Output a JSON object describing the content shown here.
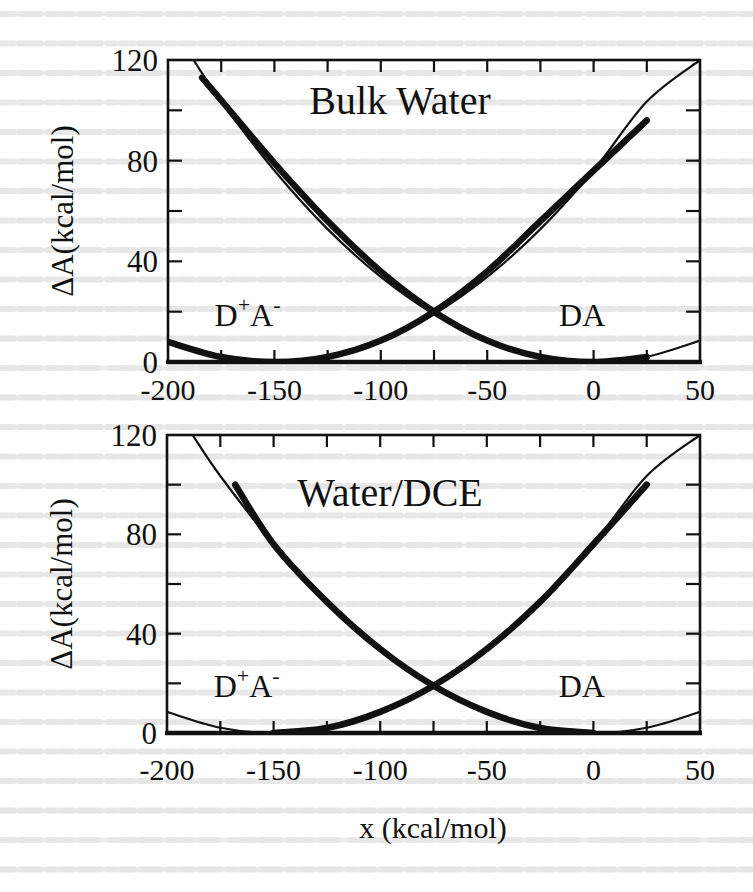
{
  "figure": {
    "xlabel": "x (kcal/mol)",
    "ylabel": "ΔA(kcal/mol)",
    "colors": {
      "ink": "#111111",
      "background": "#ffffff",
      "bleed_text": "#d9d9d9"
    }
  },
  "chart_data": [
    {
      "type": "line",
      "title": "Bulk Water",
      "xlabel": "x (kcal/mol)",
      "ylabel": "ΔA(kcal/mol)",
      "xlim": [
        -200,
        50
      ],
      "ylim": [
        0,
        120
      ],
      "xticks": [
        -200,
        -150,
        -100,
        -50,
        0,
        50
      ],
      "xtick_labels": [
        "-200",
        "-150",
        "-100",
        "-50",
        "0",
        "50"
      ],
      "yticks": [
        0,
        40,
        80,
        120
      ],
      "ytick_labels": [
        "0",
        "40",
        "80",
        "120"
      ],
      "minor_xticks": [
        -175,
        -125,
        -75,
        -25,
        25
      ],
      "minor_yticks": [
        20,
        60,
        100
      ],
      "grid": false,
      "annotations": [
        {
          "text": "D+A-",
          "label_main": "D",
          "sup1": "+",
          "mid": "A",
          "sup2": "-",
          "x": -180,
          "y": 20
        },
        {
          "text": "DA",
          "x": -20,
          "y": 20
        }
      ],
      "series": [
        {
          "name": "DA (parabola, thin)",
          "style": "thin",
          "x": [
            -188,
            -175,
            -150,
            -125,
            -100,
            -75,
            -50,
            -25,
            0,
            25,
            50
          ],
          "y": [
            120,
            103.5,
            76.1,
            52.8,
            33.8,
            19.0,
            8.5,
            2.1,
            0,
            2.1,
            8.5
          ]
        },
        {
          "name": "D+A- (parabola, thin)",
          "style": "thin",
          "x": [
            -200,
            -175,
            -150,
            -125,
            -100,
            -75,
            -50,
            -25,
            0,
            25,
            50
          ],
          "y": [
            8.5,
            2.1,
            0,
            2.1,
            8.5,
            19.0,
            33.8,
            52.8,
            76.1,
            103.5,
            120
          ]
        },
        {
          "name": "DA (simulation, thick)",
          "style": "thick",
          "x": [
            -184,
            -175,
            -150,
            -125,
            -100,
            -75,
            -50,
            -25,
            0,
            25
          ],
          "y": [
            113,
            104,
            79,
            56,
            36,
            20,
            8.5,
            2,
            0,
            2
          ]
        },
        {
          "name": "D+A- (simulation, thick)",
          "style": "thick",
          "x": [
            -200,
            -175,
            -150,
            -125,
            -100,
            -75,
            -50,
            -25,
            0,
            25
          ],
          "y": [
            8,
            2,
            0,
            2,
            8.5,
            20,
            36,
            56,
            76,
            96
          ]
        }
      ]
    },
    {
      "type": "line",
      "title": "Water/DCE",
      "xlabel": "x (kcal/mol)",
      "ylabel": "ΔA(kcal/mol)",
      "xlim": [
        -200,
        50
      ],
      "ylim": [
        0,
        120
      ],
      "xticks": [
        -200,
        -150,
        -100,
        -50,
        0,
        50
      ],
      "xtick_labels": [
        "-200",
        "-150",
        "-100",
        "-50",
        "0",
        "50"
      ],
      "yticks": [
        0,
        40,
        80,
        120
      ],
      "ytick_labels": [
        "0",
        "40",
        "80",
        "120"
      ],
      "minor_xticks": [
        -175,
        -125,
        -75,
        -25,
        25
      ],
      "minor_yticks": [
        20,
        60,
        100
      ],
      "grid": false,
      "annotations": [
        {
          "text": "D+A-",
          "label_main": "D",
          "sup1": "+",
          "mid": "A",
          "sup2": "-",
          "x": -180,
          "y": 20
        },
        {
          "text": "DA",
          "x": -20,
          "y": 20
        }
      ],
      "series": [
        {
          "name": "DA (parabola, thin)",
          "style": "thin",
          "x": [
            -188,
            -175,
            -150,
            -125,
            -100,
            -75,
            -50,
            -25,
            0,
            25,
            50
          ],
          "y": [
            120,
            103.5,
            76.1,
            52.8,
            33.8,
            19.0,
            8.5,
            2.1,
            0,
            2.1,
            8.5
          ]
        },
        {
          "name": "D+A- (parabola, thin)",
          "style": "thin",
          "x": [
            -200,
            -175,
            -150,
            -125,
            -100,
            -75,
            -50,
            -25,
            0,
            25,
            50
          ],
          "y": [
            8.5,
            2.1,
            0,
            2.1,
            8.5,
            19.0,
            33.8,
            52.8,
            76.1,
            103.5,
            120
          ]
        },
        {
          "name": "DA (simulation, thick)",
          "style": "thick",
          "x": [
            -168,
            -150,
            -125,
            -100,
            -75,
            -50,
            -25,
            0
          ],
          "y": [
            100,
            76,
            52.8,
            33.8,
            19,
            8.5,
            2,
            0
          ]
        },
        {
          "name": "D+A- (simulation, thick)",
          "style": "thick",
          "x": [
            -150,
            -125,
            -100,
            -75,
            -50,
            -25,
            0,
            25
          ],
          "y": [
            0,
            2,
            8.5,
            19,
            33.8,
            52.8,
            76,
            100
          ]
        }
      ]
    }
  ]
}
